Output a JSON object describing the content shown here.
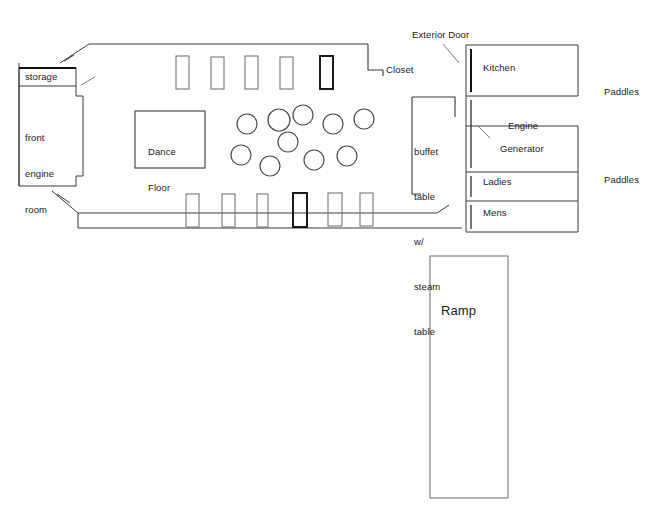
{
  "title_fragment": "",
  "hull": {
    "name": "main deck outline"
  },
  "rooms": {
    "storage": "storage",
    "front_engine_room": [
      "front",
      "engine",
      "room"
    ],
    "dance_floor": [
      "Dance",
      "Floor"
    ],
    "buffet": [
      "buffet",
      "table",
      "w/",
      "steam",
      "table"
    ],
    "closet": "Closet",
    "exterior_door": "Exterior Door",
    "kitchen": "Kitchen",
    "engine_generator": [
      "Engine",
      "Generator"
    ],
    "ladies": "Ladies",
    "mens": "Mens",
    "ramp": "Ramp",
    "paddles_upper": "Paddles",
    "paddles_lower": "Paddles"
  },
  "furniture": {
    "top_rectangles_count": 5,
    "bottom_rectangles_count": 6,
    "round_tables_count": 10,
    "top_rectangles": [
      {
        "x": 176,
        "y": 56,
        "w": 13,
        "h": 33,
        "bold": false
      },
      {
        "x": 211,
        "y": 57,
        "w": 13,
        "h": 32,
        "bold": false
      },
      {
        "x": 245,
        "y": 56,
        "w": 13,
        "h": 33,
        "bold": false
      },
      {
        "x": 280,
        "y": 57,
        "w": 13,
        "h": 32,
        "bold": false
      },
      {
        "x": 320,
        "y": 56,
        "w": 13,
        "h": 33,
        "bold": true
      }
    ],
    "bottom_rectangles": [
      {
        "x": 186,
        "y": 194,
        "w": 13,
        "h": 33,
        "bold": false
      },
      {
        "x": 222,
        "y": 194,
        "w": 13,
        "h": 33,
        "bold": false
      },
      {
        "x": 257,
        "y": 194,
        "w": 11,
        "h": 33,
        "bold": false
      },
      {
        "x": 293,
        "y": 193,
        "w": 14,
        "h": 34,
        "bold": true
      },
      {
        "x": 328,
        "y": 193,
        "w": 14,
        "h": 33,
        "bold": false
      },
      {
        "x": 360,
        "y": 193,
        "w": 13,
        "h": 33,
        "bold": false
      }
    ],
    "round_tables": [
      {
        "cx": 247,
        "cy": 124,
        "r": 10
      },
      {
        "cx": 279,
        "cy": 120,
        "r": 11
      },
      {
        "cx": 303,
        "cy": 115,
        "r": 10
      },
      {
        "cx": 333,
        "cy": 124,
        "r": 10
      },
      {
        "cx": 364,
        "cy": 119,
        "r": 10
      },
      {
        "cx": 288,
        "cy": 142,
        "r": 10
      },
      {
        "cx": 241,
        "cy": 155,
        "r": 10
      },
      {
        "cx": 270,
        "cy": 166,
        "r": 10
      },
      {
        "cx": 314,
        "cy": 160,
        "r": 10
      },
      {
        "cx": 347,
        "cy": 156,
        "r": 10
      }
    ]
  },
  "colors": {
    "line": "#3a3a3a",
    "line_bold": "#111111",
    "background": "#ffffff",
    "text": "#1a1a1a"
  }
}
